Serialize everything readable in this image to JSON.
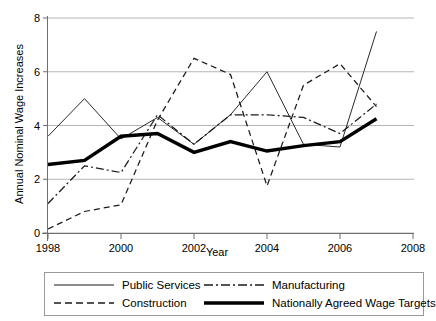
{
  "chart_data": {
    "type": "line",
    "title": "",
    "xlabel": "Year",
    "ylabel": "Annual Nominal Wage Increases",
    "xlim": [
      1998,
      2008
    ],
    "ylim": [
      0,
      8
    ],
    "xticks": [
      1998,
      2000,
      2002,
      2004,
      2006,
      2008
    ],
    "yticks": [
      0,
      2,
      4,
      6,
      8
    ],
    "grid": "horizontal",
    "legend_position": "bottom",
    "x": [
      1998,
      1999,
      2000,
      2001,
      2002,
      2003,
      2004,
      2005,
      2006,
      2007
    ],
    "series": [
      {
        "name": "Public Services",
        "style": "solid-thin",
        "values": [
          3.6,
          5.0,
          3.5,
          4.3,
          3.3,
          4.4,
          6.0,
          3.3,
          3.2,
          7.5
        ]
      },
      {
        "name": "Construction",
        "style": "dashed",
        "values": [
          0.15,
          0.8,
          1.05,
          4.2,
          6.5,
          5.9,
          1.75,
          5.5,
          6.3,
          4.7
        ]
      },
      {
        "name": "Manufacturing",
        "style": "dash-dot",
        "values": [
          1.1,
          2.5,
          2.25,
          4.4,
          3.3,
          4.4,
          4.4,
          4.3,
          3.7,
          4.8
        ]
      },
      {
        "name": "Nationally Agreed Wage Targets",
        "style": "solid-thick",
        "values": [
          2.55,
          2.7,
          3.6,
          3.7,
          3.0,
          3.4,
          3.05,
          3.25,
          3.4,
          4.25
        ]
      }
    ]
  },
  "axes": {
    "ytick_labels": [
      "0",
      "2",
      "4",
      "6",
      "8"
    ],
    "xtick_labels": [
      "1998",
      "2000",
      "2002",
      "2004",
      "2006",
      "2008"
    ],
    "ylabel": "Annual Nominal Wage Increases",
    "xlabel": "Year"
  },
  "legend": {
    "entries": [
      {
        "label": "Public Services",
        "style": "solid-thin"
      },
      {
        "label": "Manufacturing",
        "style": "dash-dot"
      },
      {
        "label": "Construction",
        "style": "dashed"
      },
      {
        "label": "Nationally Agreed Wage Targets",
        "style": "solid-thick"
      }
    ]
  },
  "colors": {
    "line": "#1a1a1a",
    "grid": "#b5b5b5",
    "axis": "#6f6f6f",
    "background": "#ffffff"
  }
}
